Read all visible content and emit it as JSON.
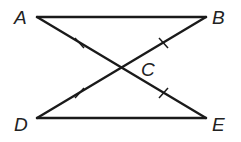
{
  "diagram": {
    "type": "geometry",
    "points": {
      "A": {
        "label": "A",
        "x": 37,
        "y": 17
      },
      "B": {
        "label": "B",
        "x": 206,
        "y": 17
      },
      "C": {
        "label": "C",
        "x": 122,
        "y": 68
      },
      "D": {
        "label": "D",
        "x": 37,
        "y": 118
      },
      "E": {
        "label": "E",
        "x": 206,
        "y": 118
      }
    },
    "segments": [
      "AB",
      "AE",
      "BD",
      "DE"
    ],
    "congruence_marks": [
      "AC",
      "BC",
      "DC",
      "EC"
    ],
    "labels": {
      "A": "A",
      "B": "B",
      "C": "C",
      "D": "D",
      "E": "E"
    }
  }
}
